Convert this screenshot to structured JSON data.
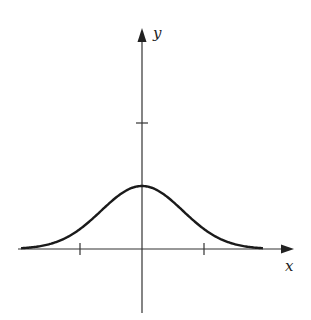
{
  "chart_data": {
    "type": "line",
    "title": "",
    "xlabel": "x",
    "ylabel": "y",
    "function": "y = 0.5 * exp(-x^2)",
    "x_ticks": [
      -1,
      1
    ],
    "y_ticks": [
      1
    ],
    "xlim": [
      -2,
      2.4
    ],
    "ylim": [
      -1,
      1.7
    ],
    "grid": false,
    "legend": null,
    "series": [
      {
        "name": "bell curve",
        "x": [
          -1.95,
          -1.5,
          -1.0,
          -0.5,
          0,
          0.5,
          1.0,
          1.5,
          1.95
        ],
        "values": [
          0.011,
          0.053,
          0.184,
          0.389,
          0.5,
          0.389,
          0.184,
          0.053,
          0.011
        ]
      }
    ]
  },
  "labels": {
    "x": "x",
    "y": "y"
  },
  "colors": {
    "curve": "#1a1a1a",
    "axes": "#333333"
  }
}
